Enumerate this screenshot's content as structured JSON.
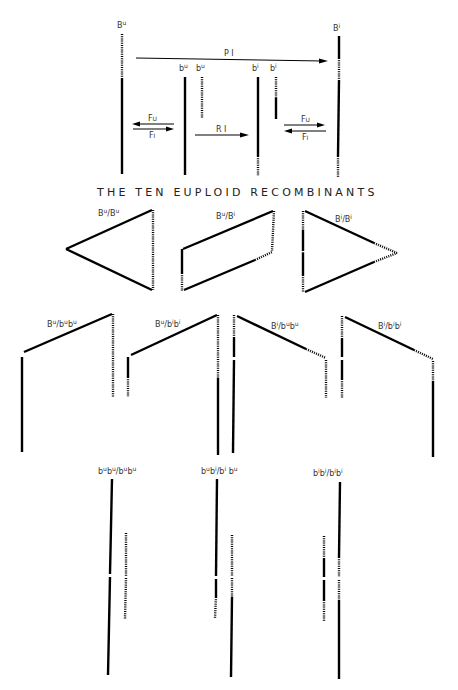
{
  "diagram": {
    "title": "THE TEN EUPLOID RECOMBINANTS",
    "top_labels": {
      "Bu": {
        "base": "B",
        "sup": "u"
      },
      "Bi": {
        "base": "B",
        "sup": "i"
      },
      "bu1": {
        "base": "b",
        "sup": "u"
      },
      "bu2": {
        "base": "b",
        "sup": "u"
      },
      "bi1": {
        "base": "b",
        "sup": "i"
      },
      "bi2": {
        "base": "b",
        "sup": "i"
      }
    },
    "arrows": {
      "pi": "P I",
      "ri": "R I",
      "fu_left": "Fu",
      "fi_left": "Fi",
      "fu_right": "Fu",
      "fi_right": "Fi"
    },
    "recombinants": [
      {
        "label": "Bu/Bu"
      },
      {
        "label": "Bu/Bi"
      },
      {
        "label": "Bi/Bi"
      },
      {
        "label": "Bu/bubu"
      },
      {
        "label": "Bu/bibi"
      },
      {
        "label": "Bi/bubu"
      },
      {
        "label": "Bi/bibi"
      },
      {
        "label": "bubu/bubu"
      },
      {
        "label": "bubi/bibu"
      },
      {
        "label": "bibi/bibi"
      }
    ],
    "legend": {
      "solid": "solid segment",
      "dotted": "dotted segment"
    }
  }
}
